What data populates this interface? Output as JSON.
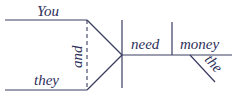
{
  "diagram": {
    "type": "sentence-diagram",
    "sentence_words": {
      "subject_top": "You",
      "subject_bottom": "they",
      "conjunction": "and",
      "verb": "need",
      "object": "money",
      "modifier": "the"
    },
    "colors": {
      "line": "#3a3c60",
      "text": "#2d2f5a",
      "background": "#ffffff"
    }
  }
}
